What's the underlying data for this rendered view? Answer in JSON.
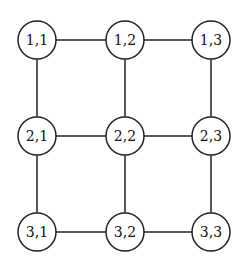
{
  "diagram": {
    "type": "grid-graph",
    "rows": 3,
    "cols": 3,
    "node_radius": 19,
    "stroke_color": "#222222",
    "fill_color": "#ffffff",
    "nodes": [
      {
        "id": "1,1",
        "label": "1,1",
        "x": 37,
        "y": 40
      },
      {
        "id": "1,2",
        "label": "1,2",
        "x": 125,
        "y": 40
      },
      {
        "id": "1,3",
        "label": "1,3",
        "x": 211,
        "y": 40
      },
      {
        "id": "2,1",
        "label": "2,1",
        "x": 37,
        "y": 136
      },
      {
        "id": "2,2",
        "label": "2,2",
        "x": 125,
        "y": 136
      },
      {
        "id": "2,3",
        "label": "2,3",
        "x": 211,
        "y": 136
      },
      {
        "id": "3,1",
        "label": "3,1",
        "x": 37,
        "y": 232
      },
      {
        "id": "3,2",
        "label": "3,2",
        "x": 125,
        "y": 232
      },
      {
        "id": "3,3",
        "label": "3,3",
        "x": 211,
        "y": 232
      }
    ],
    "edges": [
      [
        "1,1",
        "1,2"
      ],
      [
        "1,2",
        "1,3"
      ],
      [
        "2,1",
        "2,2"
      ],
      [
        "2,2",
        "2,3"
      ],
      [
        "3,1",
        "3,2"
      ],
      [
        "3,2",
        "3,3"
      ],
      [
        "1,1",
        "2,1"
      ],
      [
        "2,1",
        "3,1"
      ],
      [
        "1,2",
        "2,2"
      ],
      [
        "2,2",
        "3,2"
      ],
      [
        "1,3",
        "2,3"
      ],
      [
        "2,3",
        "3,3"
      ]
    ]
  }
}
